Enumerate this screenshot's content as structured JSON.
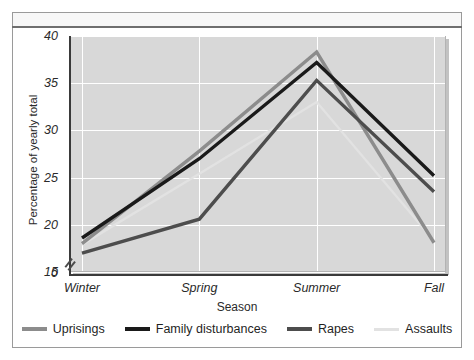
{
  "chart_data": {
    "type": "line",
    "title": "",
    "xlabel": "Season",
    "ylabel": "Percentage of yearly total",
    "categories": [
      "Winter",
      "Spring",
      "Summer",
      "Fall"
    ],
    "ylim": [
      15,
      40
    ],
    "yticks": [
      15,
      20,
      25,
      30,
      35,
      40
    ],
    "ytick_labels": [
      "15",
      "20",
      "25",
      "30",
      "35",
      "40"
    ],
    "y_axis_break": true,
    "y_axis_origin_label": "0",
    "grid": true,
    "legend_position": "bottom",
    "series": [
      {
        "name": "Uprisings",
        "color": "#8c8c8c",
        "values": [
          18.0,
          27.8,
          38.3,
          18.1
        ]
      },
      {
        "name": "Family disturbances",
        "color": "#1a1a1a",
        "values": [
          18.6,
          27.0,
          37.2,
          25.2
        ]
      },
      {
        "name": "Rapes",
        "color": "#4d4d4d",
        "values": [
          17.0,
          20.6,
          35.3,
          23.5
        ]
      },
      {
        "name": "Assaults",
        "color": "#e2e2e2",
        "values": [
          17.9,
          25.4,
          33.0,
          18.3
        ]
      }
    ]
  },
  "axis": {
    "y_title": "Percentage of yearly total",
    "x_title": "Season",
    "zero_label": "0"
  },
  "legend": {
    "items": [
      {
        "label": "Uprisings",
        "color": "#8c8c8c"
      },
      {
        "label": "Family disturbances",
        "color": "#1a1a1a"
      },
      {
        "label": "Rapes",
        "color": "#4d4d4d"
      },
      {
        "label": "Assaults",
        "color": "#e2e2e2"
      }
    ]
  }
}
